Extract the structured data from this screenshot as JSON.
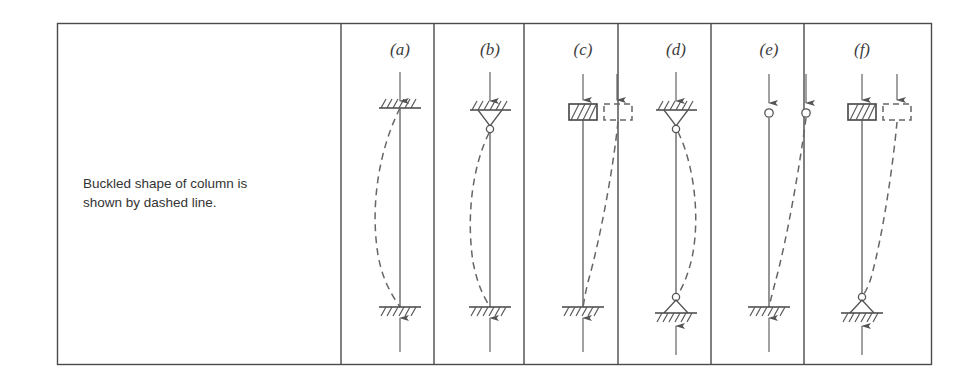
{
  "figure": {
    "background_color": "#ffffff",
    "line_color": "#555555",
    "frame_color": "#4a4a4a",
    "dashed_color": "#666666",
    "caption": {
      "line1": "Buckled shape of column is",
      "line2": "shown by dashed line."
    },
    "panels": [
      {
        "id": "a",
        "label": "(a)",
        "end_condition": "fixed-fixed",
        "top_support": "fixed-hatched",
        "bottom_support": "fixed-hatched",
        "buckled_mode": "s-curve-left",
        "top_load_arrow": "down",
        "bottom_load_arrow": "up"
      },
      {
        "id": "b",
        "label": "(b)",
        "end_condition": "pinned-fixed",
        "top_support": "pinned-hanging",
        "bottom_support": "fixed-hatched",
        "buckled_mode": "single-bow-left",
        "top_load_arrow": "down",
        "bottom_load_arrow": "up"
      },
      {
        "id": "c",
        "label": "(c)",
        "end_condition": "fixed-guided",
        "top_support": "guided-block",
        "bottom_support": "fixed-hatched",
        "buckled_mode": "sway-right",
        "top_load_arrow": "down",
        "bottom_load_arrow": "up"
      },
      {
        "id": "d",
        "label": "(d)",
        "end_condition": "pinned-pinned",
        "top_support": "pinned-hanging",
        "bottom_support": "pinned-ground",
        "buckled_mode": "single-bow-right",
        "top_load_arrow": "down",
        "bottom_load_arrow": "up"
      },
      {
        "id": "e",
        "label": "(e)",
        "end_condition": "fixed-free",
        "top_support": "free-pin",
        "bottom_support": "fixed-hatched",
        "buckled_mode": "cantilever-sway-right",
        "top_load_arrow": "down",
        "bottom_load_arrow": "up"
      },
      {
        "id": "f",
        "label": "(f)",
        "end_condition": "pinned-guided",
        "top_support": "guided-block",
        "bottom_support": "pinned-ground",
        "buckled_mode": "sway-right",
        "top_load_arrow": "down",
        "bottom_load_arrow": "up"
      }
    ]
  }
}
